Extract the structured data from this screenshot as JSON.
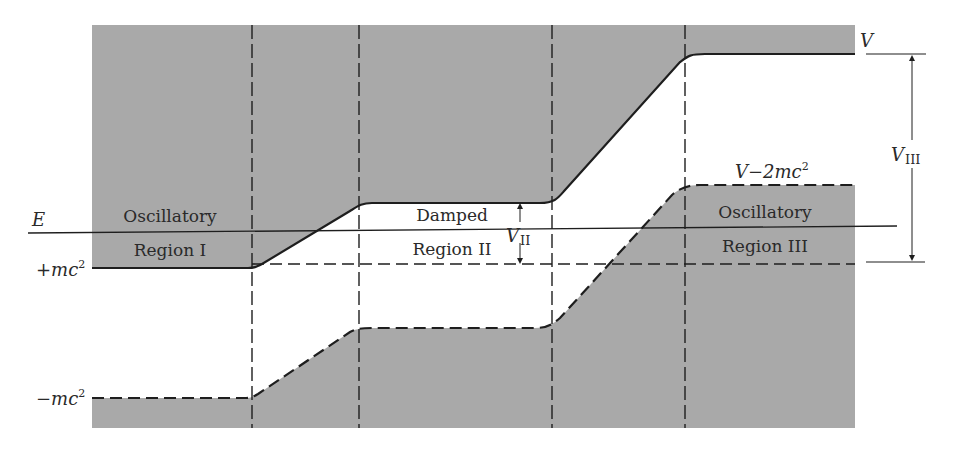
{
  "diagram": {
    "colors": {
      "shade": "#a9a9a9",
      "line": "#1e1e1e",
      "background": "#ffffff"
    },
    "levels": {
      "E": "E",
      "plus_mc2_prefix": "+mc",
      "minus_mc2_prefix": "−mc",
      "sup2": "2",
      "V": "V",
      "V_minus_2mc2_prefix": "V−2mc",
      "V_II_main": "V",
      "V_II_sub": "II",
      "V_III_main": "V",
      "V_III_sub": "III"
    },
    "regions": [
      {
        "line1": "Oscillatory",
        "line2": "Region I"
      },
      {
        "line1": "Damped",
        "line2": "Region II"
      },
      {
        "line1": "Oscillatory",
        "line2": "Region III"
      }
    ]
  }
}
